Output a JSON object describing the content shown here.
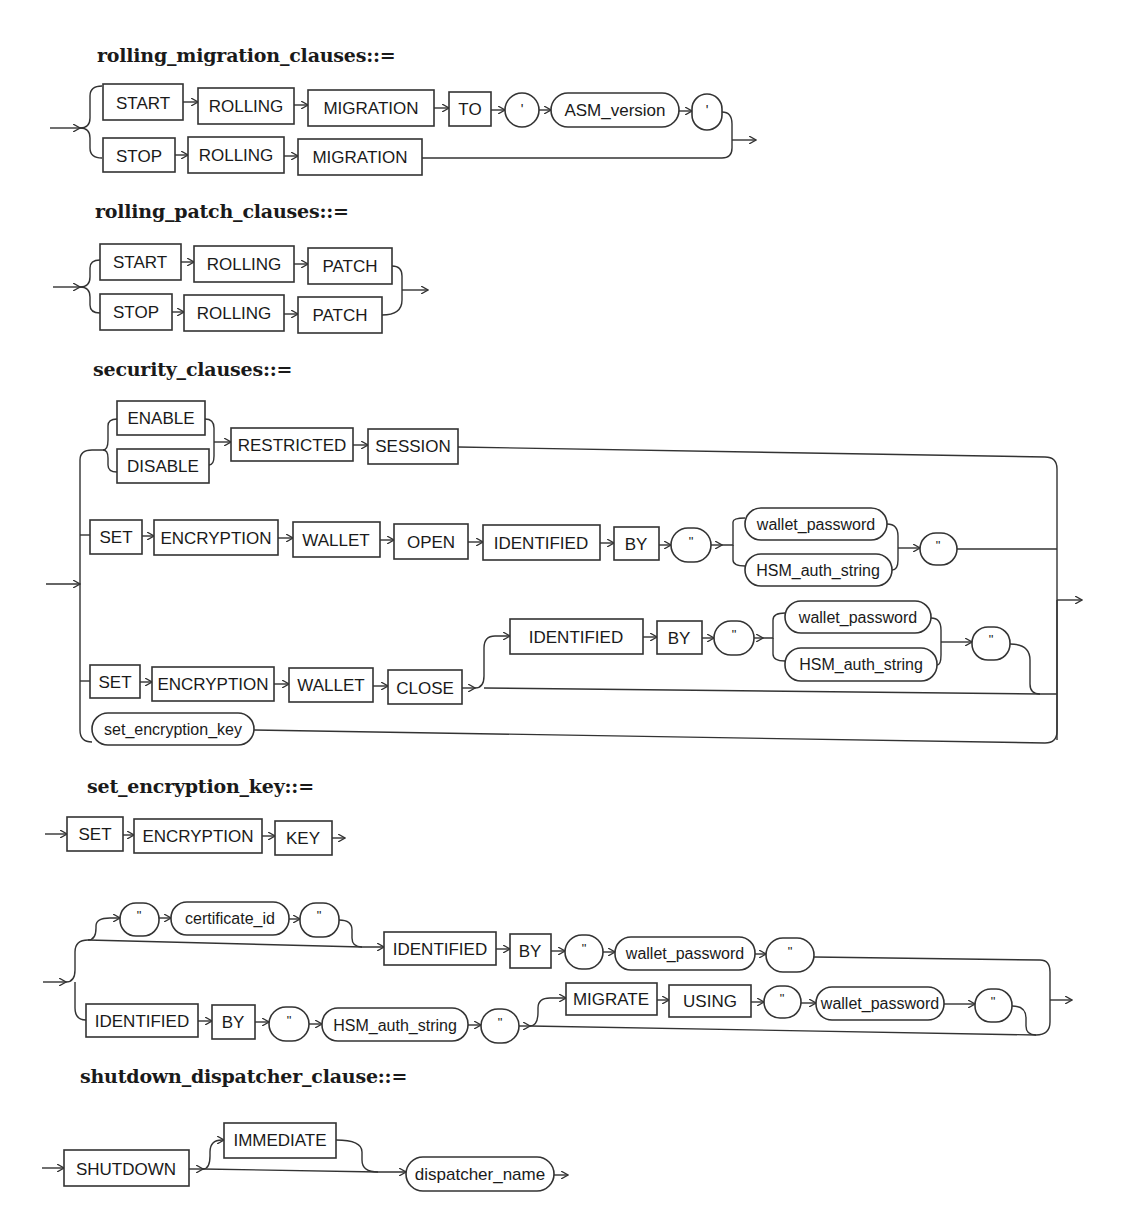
{
  "diagrams": [
    {
      "title": "rolling_migration_clauses::=",
      "branches": [
        [
          "START",
          "ROLLING",
          "MIGRATION",
          "TO",
          "'",
          "ASM_version",
          "'"
        ],
        [
          "STOP",
          "ROLLING",
          "MIGRATION"
        ]
      ]
    },
    {
      "title": "rolling_patch_clauses::=",
      "branches": [
        [
          "START",
          "ROLLING",
          "PATCH"
        ],
        [
          "STOP",
          "ROLLING",
          "PATCH"
        ]
      ]
    },
    {
      "title": "security_clauses::=",
      "branches": [
        {
          "choice": [
            "ENABLE",
            "DISABLE"
          ],
          "then": [
            "RESTRICTED",
            "SESSION"
          ]
        },
        {
          "seq": [
            "SET",
            "ENCRYPTION",
            "WALLET",
            "OPEN",
            "IDENTIFIED",
            "BY",
            "\""
          ],
          "choice": [
            "wallet_password",
            "HSM_auth_string"
          ],
          "end": "\""
        },
        {
          "seq": [
            "SET",
            "ENCRYPTION",
            "WALLET",
            "CLOSE"
          ],
          "optional": [
            "IDENTIFIED",
            "BY",
            "\""
          ],
          "choice": [
            "wallet_password",
            "HSM_auth_string"
          ],
          "end": "\""
        },
        {
          "seq": [
            "set_encryption_key"
          ]
        }
      ]
    },
    {
      "title": "set_encryption_key::=",
      "line1": [
        "SET",
        "ENCRYPTION",
        "KEY"
      ],
      "branches": [
        {
          "optional": [
            "\"",
            "certificate_id",
            "\""
          ],
          "seq": [
            "IDENTIFIED",
            "BY",
            "\"",
            "wallet_password",
            "\""
          ]
        },
        {
          "seq": [
            "IDENTIFIED",
            "BY",
            "\"",
            "HSM_auth_string",
            "\""
          ],
          "optional": [
            "MIGRATE",
            "USING",
            "\"",
            "wallet_password",
            "\""
          ]
        }
      ]
    },
    {
      "title": "shutdown_dispatcher_clause::=",
      "seq": [
        "SHUTDOWN"
      ],
      "optional": [
        "IMMEDIATE"
      ],
      "end": "dispatcher_name"
    }
  ],
  "labels": {
    "rm_start": "START",
    "rm_rolling1": "ROLLING",
    "rm_migration1": "MIGRATION",
    "rm_to": "TO",
    "rm_q1": "'",
    "rm_asm": "ASM_version",
    "rm_q2": "'",
    "rm_stop": "STOP",
    "rm_rolling2": "ROLLING",
    "rm_migration2": "MIGRATION",
    "rp_start": "START",
    "rp_rolling1": "ROLLING",
    "rp_patch1": "PATCH",
    "rp_stop": "STOP",
    "rp_rolling2": "ROLLING",
    "rp_patch2": "PATCH",
    "sc_enable": "ENABLE",
    "sc_disable": "DISABLE",
    "sc_restricted": "RESTRICTED",
    "sc_session": "SESSION",
    "sc_set1": "SET",
    "sc_enc1": "ENCRYPTION",
    "sc_wallet1": "WALLET",
    "sc_open": "OPEN",
    "sc_ident1": "IDENTIFIED",
    "sc_by1": "BY",
    "sc_q1": "\"",
    "sc_wp1": "wallet_password",
    "sc_hsm1": "HSM_auth_string",
    "sc_q2": "\"",
    "sc_ident2": "IDENTIFIED",
    "sc_by2": "BY",
    "sc_q3": "\"",
    "sc_wp2": "wallet_password",
    "sc_hsm2": "HSM_auth_string",
    "sc_q4": "\"",
    "sc_set2": "SET",
    "sc_enc2": "ENCRYPTION",
    "sc_wallet2": "WALLET",
    "sc_close": "CLOSE",
    "sc_sek": "set_encryption_key",
    "sk_set": "SET",
    "sk_enc": "ENCRYPTION",
    "sk_key": "KEY",
    "sk_q1": "\"",
    "sk_cert": "certificate_id",
    "sk_q2": "\"",
    "sk_ident1": "IDENTIFIED",
    "sk_by1": "BY",
    "sk_q3": "\"",
    "sk_wp1": "wallet_password",
    "sk_q4": "\"",
    "sk_ident2": "IDENTIFIED",
    "sk_by2": "BY",
    "sk_q5": "\"",
    "sk_hsm": "HSM_auth_string",
    "sk_q6": "\"",
    "sk_migrate": "MIGRATE",
    "sk_using": "USING",
    "sk_q7": "\"",
    "sk_wp2": "wallet_password",
    "sk_q8": "\"",
    "sd_shutdown": "SHUTDOWN",
    "sd_immediate": "IMMEDIATE",
    "sd_dispatcher": "dispatcher_name"
  }
}
